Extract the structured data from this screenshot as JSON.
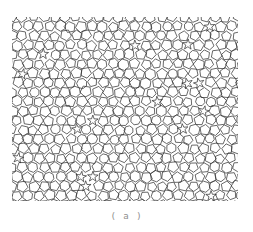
{
  "page": {
    "width": 253,
    "height": 232,
    "background": "#ffffff"
  },
  "figure": {
    "caption": "( a )",
    "caption_color": "#8e8e8e",
    "pattern": {
      "type": "cell-network",
      "description": "dense random network of small pentagons, hexagons and star-shaped gaps",
      "stroke_color": "#2e2e2e",
      "stroke_width": 0.8,
      "background": "#ffffff",
      "area": {
        "x": 12,
        "y": 17,
        "width": 226,
        "height": 184
      },
      "cell_size": 10.7,
      "row_height": 9.4,
      "seed": 11
    }
  }
}
